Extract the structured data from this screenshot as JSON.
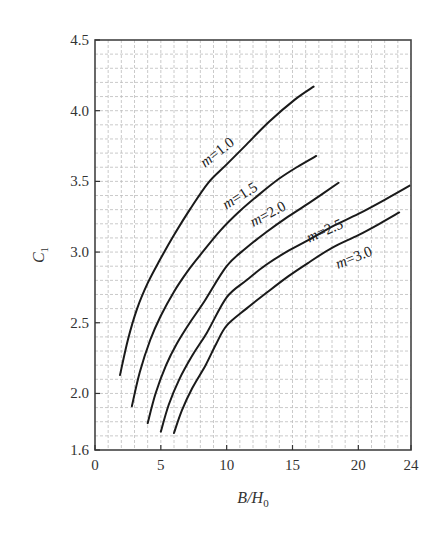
{
  "chart_data": {
    "type": "line",
    "title": "",
    "xlabel": "B/H0",
    "xlabel_main": "B/H",
    "xlabel_sub": "0",
    "ylabel": "C1",
    "ylabel_main": "C",
    "ylabel_sub": "1",
    "xlim": [
      0,
      24
    ],
    "ylim": [
      1.6,
      4.5
    ],
    "xticks": [
      0,
      5,
      10,
      15,
      20,
      24
    ],
    "xtick_labels": [
      "0",
      "5",
      "10",
      "15",
      "20",
      "24"
    ],
    "yticks": [
      1.6,
      2.0,
      2.5,
      3.0,
      3.5,
      4.0,
      4.5
    ],
    "ytick_labels": [
      "1.6",
      "2.0",
      "2.5",
      "3.0",
      "3.5",
      "4.0",
      "4.5"
    ],
    "grid": true,
    "grid_minor_x": 1,
    "grid_minor_y": 0.1,
    "legend_position": "inline-labels",
    "series": [
      {
        "name": "m=1.0",
        "label": "m=1.0",
        "x": [
          1.9,
          2.5,
          3.2,
          4.0,
          4.9,
          6.0,
          7.2,
          8.6,
          10.0,
          11.5,
          13.2,
          15.2,
          16.6
        ],
        "y": [
          2.13,
          2.38,
          2.6,
          2.78,
          2.94,
          3.12,
          3.3,
          3.49,
          3.62,
          3.76,
          3.92,
          4.08,
          4.17
        ]
      },
      {
        "name": "m=1.5",
        "label": "m=1.5",
        "x": [
          2.8,
          3.4,
          4.2,
          5.0,
          6.0,
          7.0,
          8.0,
          9.5,
          11.0,
          12.5,
          14.0,
          15.5,
          16.8
        ],
        "y": [
          1.91,
          2.15,
          2.38,
          2.55,
          2.72,
          2.86,
          2.98,
          3.15,
          3.29,
          3.41,
          3.52,
          3.61,
          3.68
        ]
      },
      {
        "name": "m=2.0",
        "label": "m=2.0",
        "x": [
          4.0,
          4.6,
          5.4,
          6.2,
          7.2,
          8.3,
          10.0,
          11.5,
          13.0,
          14.5,
          16.3,
          18.5
        ],
        "y": [
          1.79,
          2.0,
          2.2,
          2.35,
          2.5,
          2.65,
          2.9,
          3.03,
          3.14,
          3.24,
          3.35,
          3.49
        ]
      },
      {
        "name": "m=2.5",
        "label": "m=2.5",
        "x": [
          5.0,
          5.6,
          6.4,
          7.4,
          8.5,
          10.0,
          11.5,
          13.0,
          14.7,
          16.3,
          18.0,
          20.0,
          22.0,
          23.9
        ],
        "y": [
          1.73,
          1.92,
          2.1,
          2.27,
          2.43,
          2.68,
          2.8,
          2.91,
          3.01,
          3.09,
          3.18,
          3.27,
          3.37,
          3.47
        ]
      },
      {
        "name": "m=3.0",
        "label": "m=3.0",
        "x": [
          6.0,
          6.6,
          7.4,
          8.4,
          9.2,
          10.0,
          11.5,
          13.0,
          14.7,
          16.3,
          18.0,
          20.0,
          21.6,
          23.1
        ],
        "y": [
          1.72,
          1.88,
          2.04,
          2.2,
          2.35,
          2.48,
          2.6,
          2.71,
          2.83,
          2.93,
          3.03,
          3.12,
          3.2,
          3.28
        ]
      }
    ],
    "annotations": [
      {
        "text": "m=1.0",
        "x": 9.5,
        "y": 3.68,
        "angle": -38
      },
      {
        "text": "m=1.5",
        "x": 11.2,
        "y": 3.37,
        "angle": -32
      },
      {
        "text": "m=2.0",
        "x": 13.3,
        "y": 3.24,
        "angle": -28
      },
      {
        "text": "m=2.5",
        "x": 17.6,
        "y": 3.12,
        "angle": -24
      },
      {
        "text": "m=3.0",
        "x": 19.8,
        "y": 2.93,
        "angle": -22
      }
    ]
  },
  "caption": "图 ... C1 与 B/H0 关系图"
}
